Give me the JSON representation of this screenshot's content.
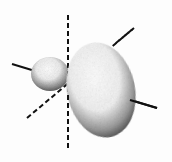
{
  "diagram": {
    "title": "Hybrid orbital (sp) lobes with coordinate axes",
    "elements": {
      "vertical_axis": {
        "style": "dashed",
        "x": 68,
        "y1": 15,
        "y2": 150
      },
      "diagonal_axis": {
        "style": "dashed",
        "x1": 27,
        "y1": 118,
        "x2": 134,
        "y2": 28
      },
      "bond_axis": {
        "style": "solid",
        "x1": 12,
        "y1": 64,
        "x2": 157,
        "y2": 108
      },
      "small_lobe": {
        "cx": 50,
        "cy": 74,
        "rx": 19,
        "ry": 17
      },
      "large_lobe": {
        "cx": 101,
        "cy": 90,
        "rx": 34,
        "ry": 48,
        "rotate": -12
      }
    },
    "colors": {
      "line": "#111111",
      "shade_dark": "#2a2a2a",
      "shade_light": "#ffffff",
      "background": "#fdfdfd"
    }
  }
}
